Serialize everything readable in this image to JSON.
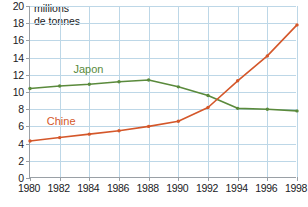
{
  "chart_data": {
    "type": "line",
    "title": "",
    "subtitle": "",
    "xlabel": "",
    "ylabel": "millions de tonnes",
    "ylabel_line1": "millions",
    "ylabel_line2": "de tonnes",
    "x": [
      1980,
      1982,
      1984,
      1986,
      1988,
      1990,
      1992,
      1994,
      1996,
      1998
    ],
    "categories": [
      "1980",
      "1982",
      "1984",
      "1986",
      "1988",
      "1990",
      "1992",
      "1994",
      "1996",
      "1998"
    ],
    "xlim": [
      1980,
      1998
    ],
    "ylim": [
      0,
      20
    ],
    "yticks": [
      0,
      2,
      4,
      6,
      8,
      10,
      12,
      14,
      16,
      18,
      20
    ],
    "ytick_labels": [
      "0",
      "2",
      "4",
      "6",
      "8",
      "10",
      "12",
      "14",
      "16",
      "18",
      "20"
    ],
    "grid": true,
    "grid_color": "#bdd7e7",
    "legend": "inline-labels",
    "series": [
      {
        "name": "Japon",
        "color": "#5a8a3c",
        "values": [
          10.4,
          10.7,
          10.9,
          11.2,
          11.4,
          10.6,
          9.6,
          8.1,
          8.0,
          7.8
        ],
        "label_x": 1983,
        "label_y": 12.6
      },
      {
        "name": "Chine",
        "color": "#d4572a",
        "values": [
          4.3,
          4.7,
          5.1,
          5.5,
          6.0,
          6.6,
          8.2,
          11.3,
          14.2,
          17.8
        ],
        "label_x": 1981.2,
        "label_y": 6.5
      }
    ]
  },
  "axis": {
    "y_title_line1": "millions",
    "y_title_line2": "de tonnes"
  },
  "colors": {
    "japon": "#5a8a3c",
    "chine": "#d4572a",
    "grid": "#bdd7e7",
    "axis": "#9aa0a6",
    "text": "#202124",
    "background": "#ffffff"
  }
}
